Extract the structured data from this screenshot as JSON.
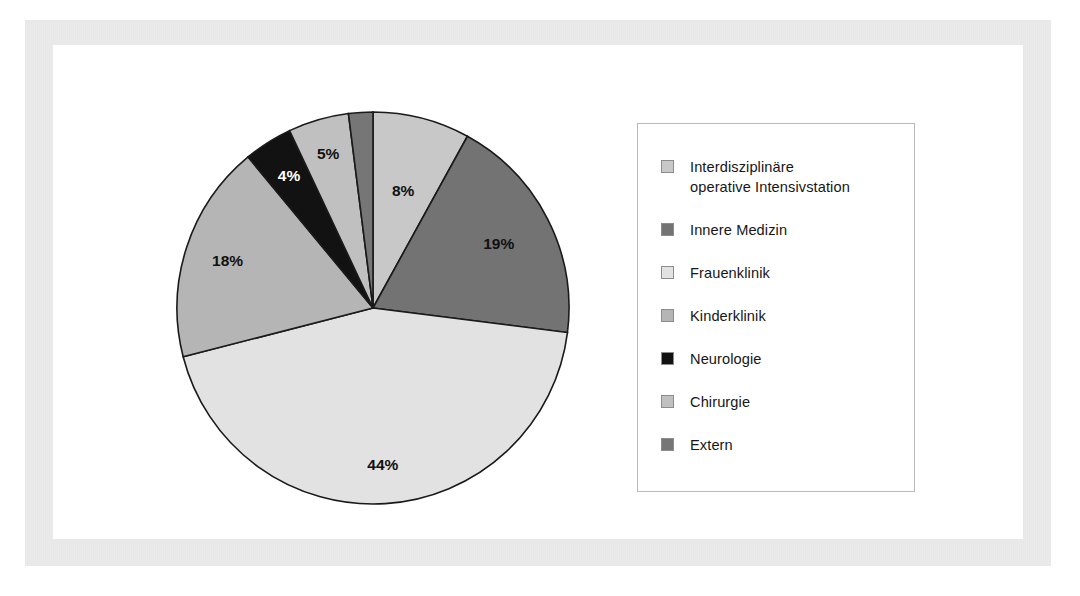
{
  "figure": {
    "background_color": "#ffffff",
    "scan_frame_color": "#eaeaea",
    "plate_color": "#ffffff"
  },
  "legend": {
    "border_color": "#b9b9b9",
    "entries": [
      {
        "label": "Interdisziplinäre\noperative Intensivstation",
        "color": "#c8c8c8",
        "swatch_name": "legend-swatch-interdisziplinaere-operative-intensivstation"
      },
      {
        "label": "Innere Medizin",
        "color": "#737373",
        "swatch_name": "legend-swatch-innere-medizin"
      },
      {
        "label": "Frauenklinik",
        "color": "#e2e2e2",
        "swatch_name": "legend-swatch-frauenklinik"
      },
      {
        "label": "Kinderklinik",
        "color": "#b5b5b5",
        "swatch_name": "legend-swatch-kinderklinik"
      },
      {
        "label": "Neurologie",
        "color": "#121212",
        "swatch_name": "legend-swatch-neurologie"
      },
      {
        "label": "Chirurgie",
        "color": "#c0c0c0",
        "swatch_name": "legend-swatch-chirurgie"
      },
      {
        "label": "Extern",
        "color": "#767676",
        "swatch_name": "legend-swatch-extern"
      }
    ]
  },
  "labels": {
    "s8": "8%",
    "s19": "19%",
    "s44": "44%",
    "s18": "18%",
    "s4": "4%",
    "s5": "5%",
    "s2": "2%"
  },
  "chart_data": {
    "type": "pie",
    "title": "",
    "subtitle": "",
    "xlabel": "",
    "ylabel": "",
    "grid": false,
    "legend_position": "right",
    "units": "percent",
    "start_angle_deg": 0,
    "direction": "clockwise",
    "total": 100,
    "categories": [
      "Interdisziplinäre operative Intensivstation",
      "Innere Medizin",
      "Frauenklinik",
      "Kinderklinik",
      "Neurologie",
      "Chirurgie",
      "Extern"
    ],
    "values": [
      8,
      19,
      44,
      18,
      4,
      5,
      2
    ],
    "data_labels": [
      "8%",
      "19%",
      "44%",
      "18%",
      "4%",
      "5%",
      "2%"
    ],
    "colors": [
      "#c8c8c8",
      "#737373",
      "#e2e2e2",
      "#b5b5b5",
      "#121212",
      "#c0c0c0",
      "#767676"
    ],
    "slice_order_clockwise_from_top": [
      {
        "category": "Interdisziplinäre operative Intensivstation",
        "value": 8,
        "label": "8%",
        "color": "#c8c8c8"
      },
      {
        "category": "Innere Medizin",
        "value": 19,
        "label": "19%",
        "color": "#737373"
      },
      {
        "category": "Frauenklinik",
        "value": 44,
        "label": "44%",
        "color": "#e2e2e2"
      },
      {
        "category": "Kinderklinik",
        "value": 18,
        "label": "18%",
        "color": "#b5b5b5"
      },
      {
        "category": "Neurologie",
        "value": 4,
        "label": "4%",
        "color": "#121212"
      },
      {
        "category": "Chirurgie",
        "value": 5,
        "label": "5%",
        "color": "#c0c0c0"
      },
      {
        "category": "Extern",
        "value": 2,
        "label": "2%",
        "color": "#767676"
      }
    ],
    "slice_outline_color": "#1a1a1a"
  }
}
